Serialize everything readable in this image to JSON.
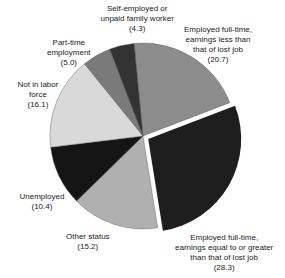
{
  "chart_data": {
    "type": "pie",
    "title": "",
    "start_angle_deg": -5.5,
    "direction": "clockwise",
    "center": [
      143,
      136
    ],
    "radius": 93,
    "slices": [
      {
        "label": "Employed full-time, earnings less than that of lost job",
        "value": 20.7,
        "color": "#8c8c8c",
        "explode": 0
      },
      {
        "label": "Employed full-time, earnings equal to or greater than that of lost job",
        "value": 28.3,
        "color": "#1e1e1e",
        "explode": 6
      },
      {
        "label": "Other status",
        "value": 15.2,
        "color": "#b0b0b0",
        "explode": 0
      },
      {
        "label": "Unemployed",
        "value": 10.4,
        "color": "#151515",
        "explode": 0
      },
      {
        "label": "Not in labor force",
        "value": 16.1,
        "color": "#d9d9d9",
        "explode": 0
      },
      {
        "label": "Part-time employment",
        "value": 5.0,
        "color": "#7a7a7a",
        "explode": 0
      },
      {
        "label": "Self-employed or unpaid family worker",
        "value": 4.3,
        "color": "#333333",
        "explode": 0
      }
    ]
  },
  "labels": [
    {
      "text": "Self-employed or\nunpaid family worker\n(4.3)",
      "x": 137,
      "y": 4
    },
    {
      "text": "Employed full-time,\nearnings less than\nthat of lost job\n(20.7)",
      "x": 218,
      "y": 25
    },
    {
      "text": "Part-time\nemployment\n(5.0)",
      "x": 69,
      "y": 38
    },
    {
      "text": "Not in labor\nforce\n(16.1)",
      "x": 38,
      "y": 80
    },
    {
      "text": "Unemployed\n(10.4)",
      "x": 42,
      "y": 192
    },
    {
      "text": "Other status\n(15.2)",
      "x": 88,
      "y": 232
    },
    {
      "text": "Employed full-time,\nearnings equal to or greater\nthan that of lost job\n(28.3)",
      "x": 224,
      "y": 233
    }
  ]
}
